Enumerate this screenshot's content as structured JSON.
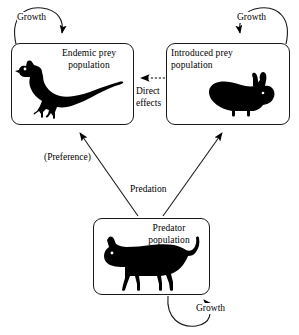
{
  "diagram": {
    "background_color": "#ffffff",
    "line_color": "#1a1a1a",
    "silhouette_color": "#000000",
    "nodes": [
      {
        "id": "endemic-prey",
        "label": "Endemic prey\npopulation",
        "animal_icon": "pheasant-silhouette"
      },
      {
        "id": "introduced-prey",
        "label": "Introduced prey\npopulation",
        "animal_icon": "rabbit-silhouette"
      },
      {
        "id": "predator",
        "label": "Predator\npopulation",
        "animal_icon": "cat-silhouette"
      }
    ],
    "edges": [
      {
        "id": "growth-endemic",
        "label": "Growth",
        "style": "solid",
        "kind": "self-loop",
        "target": "endemic-prey"
      },
      {
        "id": "growth-introduced",
        "label": "Growth",
        "style": "solid",
        "kind": "self-loop",
        "target": "introduced-prey"
      },
      {
        "id": "growth-predator",
        "label": "Growth",
        "style": "solid",
        "kind": "self-loop",
        "target": "predator"
      },
      {
        "id": "direct-effects",
        "label": "Direct\neffects",
        "style": "dashed",
        "kind": "straight",
        "source": "introduced-prey",
        "target": "endemic-prey"
      },
      {
        "id": "preference",
        "label": "(Preference)",
        "style": "solid",
        "kind": "diagonal",
        "source": "predator",
        "target": "endemic-prey"
      },
      {
        "id": "predation",
        "label": "Predation",
        "style": "solid",
        "kind": "diagonal",
        "source": "predator",
        "target": "introduced-prey"
      }
    ]
  }
}
